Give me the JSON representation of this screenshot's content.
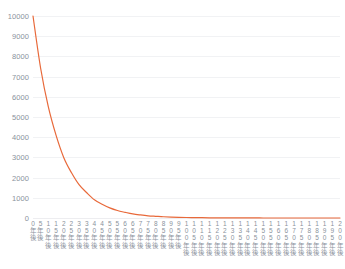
{
  "header": {
    "title": "",
    "legend": ""
  },
  "axes": {
    "y_ticks": [
      "0",
      "1000",
      "2000",
      "3000",
      "4000",
      "5000",
      "6000",
      "7000",
      "8000",
      "9000",
      "10000"
    ],
    "x_ticks": [
      "0年後",
      "5年後",
      "10年後",
      "15年後",
      "20年後",
      "25年後",
      "30年後",
      "35年後",
      "40年後",
      "45年後",
      "50年後",
      "55年後",
      "60年後",
      "65年後",
      "70年後",
      "75年後",
      "80年後",
      "85年後",
      "90年後",
      "95年後",
      "100年後",
      "105年後",
      "110年後",
      "115年後",
      "120年後",
      "125年後",
      "130年後",
      "135年後",
      "140年後",
      "145年後",
      "150年後",
      "155年後",
      "160年後",
      "165年後",
      "170年後",
      "175年後",
      "180年後",
      "185年後",
      "190年後",
      "195年後",
      "200年後"
    ]
  },
  "colors": {
    "series": "#e8693a",
    "grid": "#f1f2f4",
    "tick_text": "#8a929c"
  },
  "chart_data": {
    "type": "line",
    "title": "",
    "xlabel": "",
    "ylabel": "",
    "ylim": [
      0,
      10000
    ],
    "xlim": [
      0,
      200
    ],
    "grid": true,
    "legend_position": "top-right",
    "categories": [
      "0年後",
      "5年後",
      "10年後",
      "15年後",
      "20年後",
      "25年後",
      "30年後",
      "35年後",
      "40年後",
      "45年後",
      "50年後",
      "55年後",
      "60年後",
      "65年後",
      "70年後",
      "75年後",
      "80年後",
      "85年後",
      "90年後",
      "95年後",
      "100年後",
      "105年後",
      "110年後",
      "115年後",
      "120年後",
      "125年後",
      "130年後",
      "135年後",
      "140年後",
      "145年後",
      "150年後",
      "155年後",
      "160年後",
      "165年後",
      "170年後",
      "175年後",
      "180年後",
      "185年後",
      "190年後",
      "195年後",
      "200年後"
    ],
    "x": [
      0,
      5,
      10,
      15,
      20,
      25,
      30,
      35,
      40,
      45,
      50,
      55,
      60,
      65,
      70,
      75,
      80,
      85,
      90,
      95,
      100,
      105,
      110,
      115,
      120,
      125,
      130,
      135,
      140,
      145,
      150,
      155,
      160,
      165,
      170,
      175,
      180,
      185,
      190,
      195,
      200
    ],
    "series": [
      {
        "name": "",
        "color": "#e8693a",
        "values": [
          10000,
          7400,
          5500,
          4100,
          3000,
          2250,
          1650,
          1250,
          900,
          680,
          500,
          370,
          280,
          200,
          150,
          110,
          85,
          62,
          46,
          34,
          25,
          19,
          14,
          10,
          8,
          6,
          4,
          3,
          2,
          2,
          1,
          1,
          1,
          1,
          0,
          0,
          0,
          0,
          0,
          0,
          0
        ]
      }
    ]
  }
}
